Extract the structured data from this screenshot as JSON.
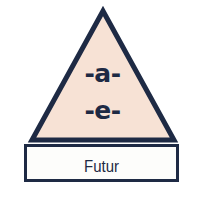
{
  "diagram": {
    "shape": "triangle-over-rectangle",
    "triangle": {
      "name": "vowel-triangle",
      "fill_color": "#f7e2d5",
      "stroke_color": "#1e2a44",
      "stroke_width": 5,
      "apex": {
        "x": 103,
        "y": 9
      },
      "base_left": {
        "x": 28,
        "y": 141
      },
      "base_right": {
        "x": 176,
        "y": 141
      },
      "labels": [
        {
          "id": "vowel-a",
          "text": "-a-"
        },
        {
          "id": "vowel-e",
          "text": "-e-"
        }
      ]
    },
    "rectangle": {
      "name": "tense-box",
      "fill_color": "#ffffff",
      "stroke_color": "#1e2a44",
      "stroke_width": 3,
      "x": 24,
      "y": 144,
      "width": 155,
      "height": 38,
      "label": "Futur"
    },
    "background_color": "#ffffff"
  }
}
